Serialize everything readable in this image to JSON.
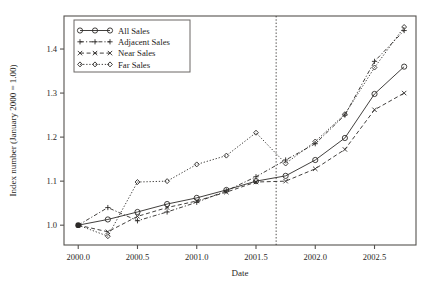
{
  "chart_data": {
    "type": "line",
    "title": "",
    "xlabel": "Date",
    "ylabel": "Index number (January 2000 = 1.00)",
    "xlim": [
      1999.88,
      2002.85
    ],
    "ylim": [
      0.955,
      1.475
    ],
    "xticks": [
      2000.0,
      2000.5,
      2001.0,
      2001.5,
      2002.0,
      2002.5
    ],
    "xticklabels": [
      "2000.0",
      "2000.5",
      "2001.0",
      "2001.5",
      "2002.0",
      "2002.5"
    ],
    "yticks": [
      1.0,
      1.1,
      1.2,
      1.3,
      1.4
    ],
    "yticklabels": [
      "1.0",
      "1.1",
      "1.2",
      "1.3",
      "1.4"
    ],
    "grid": false,
    "legend_position": "top-left",
    "annotations": [
      {
        "type": "vertical-line",
        "x": 2001.67,
        "style": "dotted"
      }
    ],
    "common_origin": {
      "x": 2000.0,
      "y": 1.0
    },
    "series": [
      {
        "name": "All Sales",
        "marker": "circle",
        "linestyle": "solid",
        "x": [
          2000.0,
          2000.25,
          2000.5,
          2000.75,
          2001.0,
          2001.25,
          2001.5,
          2001.75,
          2002.0,
          2002.25,
          2002.5,
          2002.75
        ],
        "y": [
          1.0,
          1.013,
          1.03,
          1.048,
          1.062,
          1.08,
          1.1,
          1.112,
          1.148,
          1.198,
          1.298,
          1.36
        ]
      },
      {
        "name": "Adjacent Sales",
        "marker": "plus",
        "linestyle": "dashdot",
        "x": [
          2000.0,
          2000.25,
          2000.5,
          2000.75,
          2001.0,
          2001.25,
          2001.5,
          2001.75,
          2002.0,
          2002.25,
          2002.5,
          2002.75
        ],
        "y": [
          1.0,
          1.04,
          1.01,
          1.03,
          1.052,
          1.078,
          1.11,
          1.148,
          1.185,
          1.25,
          1.372,
          1.442
        ]
      },
      {
        "name": "Near Sales",
        "marker": "cross",
        "linestyle": "dashed",
        "x": [
          2000.0,
          2000.25,
          2000.5,
          2000.75,
          2001.0,
          2001.25,
          2001.5,
          2001.75,
          2002.0,
          2002.25,
          2002.5,
          2002.75
        ],
        "y": [
          1.0,
          0.985,
          1.02,
          1.04,
          1.055,
          1.075,
          1.098,
          1.1,
          1.128,
          1.172,
          1.262,
          1.3
        ]
      },
      {
        "name": "Far Sales",
        "marker": "diamond",
        "linestyle": "dotted",
        "x": [
          2000.0,
          2000.25,
          2000.5,
          2000.75,
          2001.0,
          2001.25,
          2001.5,
          2001.75,
          2002.0,
          2002.25,
          2002.5,
          2002.75
        ],
        "y": [
          1.0,
          0.975,
          1.098,
          1.1,
          1.138,
          1.158,
          1.21,
          1.14,
          1.19,
          1.252,
          1.358,
          1.45
        ]
      }
    ]
  },
  "legend": {
    "items": [
      {
        "label": "All Sales"
      },
      {
        "label": "Adjacent Sales"
      },
      {
        "label": "Near Sales"
      },
      {
        "label": "Far Sales"
      }
    ]
  }
}
